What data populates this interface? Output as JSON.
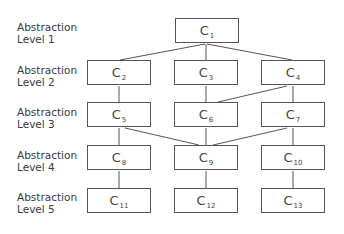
{
  "levels": [
    {
      "line1": "Abstraction",
      "line2": "Level 1"
    },
    {
      "line1": "Abstraction",
      "line2": "Level 2"
    },
    {
      "line1": "Abstraction",
      "line2": "Level 3"
    },
    {
      "line1": "Abstraction",
      "line2": "Level 4"
    },
    {
      "line1": "Abstraction",
      "line2": "Level 5"
    }
  ],
  "nodes": {
    "c1": {
      "base": "C",
      "sub": "1"
    },
    "c2": {
      "base": "C",
      "sub": "2"
    },
    "c3": {
      "base": "C",
      "sub": "3"
    },
    "c4": {
      "base": "C",
      "sub": "4"
    },
    "c5": {
      "base": "C",
      "sub": "5"
    },
    "c6": {
      "base": "C",
      "sub": "6"
    },
    "c7": {
      "base": "C",
      "sub": "7"
    },
    "c8": {
      "base": "C",
      "sub": "8"
    },
    "c9": {
      "base": "C",
      "sub": "9"
    },
    "c10": {
      "base": "C",
      "sub": "10"
    },
    "c11": {
      "base": "C",
      "sub": "11"
    },
    "c12": {
      "base": "C",
      "sub": "12"
    },
    "c13": {
      "base": "C",
      "sub": "13"
    }
  },
  "edges": [
    [
      "C1",
      "C2"
    ],
    [
      "C1",
      "C3"
    ],
    [
      "C1",
      "C4"
    ],
    [
      "C2",
      "C5"
    ],
    [
      "C3",
      "C6"
    ],
    [
      "C4",
      "C6"
    ],
    [
      "C4",
      "C7"
    ],
    [
      "C5",
      "C8"
    ],
    [
      "C5",
      "C9"
    ],
    [
      "C6",
      "C9"
    ],
    [
      "C7",
      "C9"
    ],
    [
      "C7",
      "C10"
    ],
    [
      "C8",
      "C11"
    ],
    [
      "C9",
      "C12"
    ],
    [
      "C10",
      "C13"
    ]
  ]
}
